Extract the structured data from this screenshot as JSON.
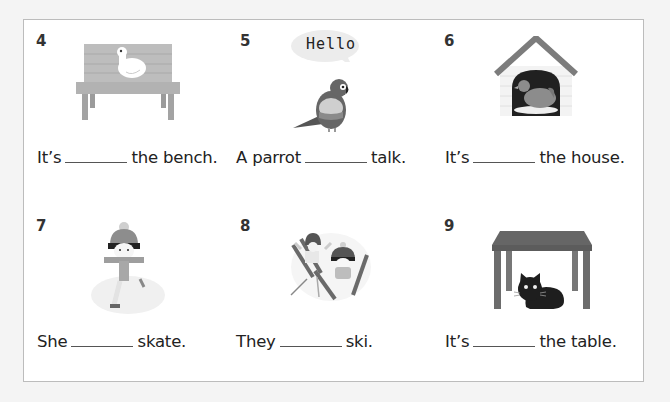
{
  "worksheet": {
    "items": [
      {
        "number": "4",
        "before": "It’s",
        "after": "the bench.",
        "picture": "duck-on-bench"
      },
      {
        "number": "5",
        "before": "A parrot",
        "after": "talk.",
        "picture": "parrot-saying-hello",
        "speech": "Hello"
      },
      {
        "number": "6",
        "before": "It’s",
        "after": "the house.",
        "picture": "hen-in-house"
      },
      {
        "number": "7",
        "before": "She",
        "after": "skate.",
        "picture": "girl-ice-skating"
      },
      {
        "number": "8",
        "before": "They",
        "after": "ski.",
        "picture": "children-skiing"
      },
      {
        "number": "9",
        "before": "It’s",
        "after": "the table.",
        "picture": "cat-under-table"
      }
    ]
  },
  "colors": {
    "background": "#f4f4f4",
    "card": "#ffffff",
    "border": "#bcbcbc",
    "text": "#222222"
  }
}
